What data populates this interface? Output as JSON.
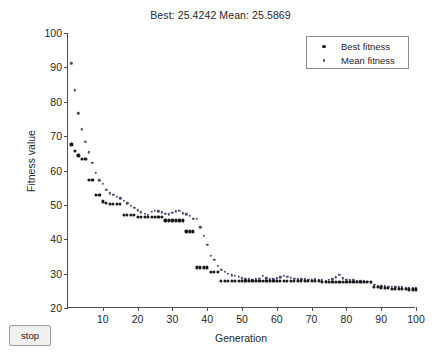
{
  "window": {
    "background_color": "#ffffff"
  },
  "controls": {
    "stop_label": "stop"
  },
  "chart_data": {
    "type": "scatter",
    "title": "Best: 25.4242 Mean: 25.5869",
    "xlabel": "Generation",
    "ylabel": "Fitness value",
    "xlim": [
      0,
      100
    ],
    "ylim": [
      20,
      100
    ],
    "xticks": [
      10,
      20,
      30,
      40,
      50,
      60,
      70,
      80,
      90,
      100
    ],
    "ytick_values": [
      20,
      30,
      40,
      50,
      60,
      70,
      80,
      90,
      100
    ],
    "grid": false,
    "legend_position": "top-right",
    "legend": [
      "Best fitness",
      "Mean fitness"
    ],
    "colors": {
      "best": "#1a1a1a",
      "mean": "#4a4a6e",
      "axis": "#4d4d4d",
      "text": "#262626"
    },
    "x": [
      1,
      2,
      3,
      4,
      5,
      6,
      7,
      8,
      9,
      10,
      11,
      12,
      13,
      14,
      15,
      16,
      17,
      18,
      19,
      20,
      21,
      22,
      23,
      24,
      25,
      26,
      27,
      28,
      29,
      30,
      31,
      32,
      33,
      34,
      35,
      36,
      37,
      38,
      39,
      40,
      41,
      42,
      43,
      44,
      45,
      46,
      47,
      48,
      49,
      50,
      51,
      52,
      53,
      54,
      55,
      56,
      57,
      58,
      59,
      60,
      61,
      62,
      63,
      64,
      65,
      66,
      67,
      68,
      69,
      70,
      71,
      72,
      73,
      74,
      75,
      76,
      77,
      78,
      79,
      80,
      81,
      82,
      83,
      84,
      85,
      86,
      87,
      88,
      89,
      90,
      91,
      92,
      93,
      94,
      95,
      96,
      97,
      98,
      99,
      100
    ],
    "series": [
      {
        "name": "Best fitness",
        "marker": "dot",
        "values": [
          67.6,
          65.7,
          64.4,
          63.4,
          63.4,
          57.3,
          57.3,
          53.0,
          53.0,
          51.0,
          50.6,
          50.4,
          50.4,
          50.3,
          50.3,
          47.0,
          47.0,
          47.0,
          47.0,
          46.5,
          46.5,
          46.4,
          46.4,
          46.4,
          46.4,
          46.4,
          46.4,
          45.5,
          45.5,
          45.5,
          45.5,
          45.5,
          45.5,
          42.3,
          42.3,
          42.3,
          31.8,
          31.8,
          31.8,
          31.8,
          30.6,
          30.6,
          30.6,
          27.9,
          27.9,
          27.9,
          27.9,
          27.9,
          27.9,
          27.9,
          27.9,
          27.9,
          27.9,
          27.9,
          27.9,
          27.9,
          27.9,
          27.9,
          27.9,
          27.9,
          27.9,
          27.9,
          27.9,
          27.9,
          27.9,
          27.9,
          27.9,
          27.9,
          27.9,
          27.9,
          27.9,
          27.9,
          27.5,
          27.5,
          27.5,
          27.5,
          27.5,
          27.5,
          27.5,
          27.5,
          27.5,
          27.5,
          27.5,
          27.5,
          27.5,
          27.5,
          27.5,
          26.2,
          26.2,
          26.0,
          25.9,
          25.8,
          25.6,
          25.5,
          25.5,
          25.5,
          25.5,
          25.4,
          25.4,
          25.4
        ]
      },
      {
        "name": "Mean fitness",
        "marker": "dot",
        "values": [
          91.2,
          83.3,
          76.6,
          72.0,
          68.3,
          65.3,
          62.2,
          59.3,
          57.2,
          56.1,
          54.3,
          53.4,
          52.9,
          52.3,
          51.9,
          51.2,
          50.5,
          49.8,
          49.1,
          48.4,
          47.8,
          47.4,
          47.2,
          47.9,
          48.3,
          48.1,
          47.8,
          47.4,
          47.3,
          47.7,
          48.1,
          48.2,
          47.6,
          47.3,
          46.8,
          46.0,
          45.9,
          43.5,
          41.0,
          38.4,
          35.2,
          34.0,
          32.3,
          31.1,
          30.5,
          29.9,
          29.5,
          29.3,
          29.0,
          28.6,
          28.4,
          28.3,
          28.2,
          28.3,
          28.5,
          29.3,
          28.6,
          28.4,
          28.4,
          28.6,
          28.9,
          29.3,
          29.0,
          28.7,
          28.5,
          28.4,
          28.3,
          28.3,
          28.2,
          28.2,
          28.3,
          28.2,
          28.1,
          28.0,
          28.2,
          28.4,
          28.9,
          29.6,
          28.6,
          28.2,
          28.1,
          28.1,
          28.0,
          27.9,
          27.8,
          27.6,
          27.4,
          26.8,
          26.4,
          26.3,
          26.3,
          26.2,
          26.1,
          26.0,
          26.0,
          26.0,
          25.9,
          25.8,
          25.8,
          25.8
        ]
      }
    ]
  }
}
